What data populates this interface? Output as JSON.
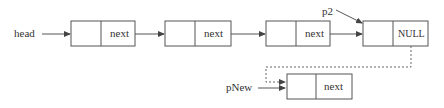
{
  "diagram": {
    "title": "",
    "labels": {
      "head": "head",
      "p2": "p2",
      "pNew": "pNew"
    },
    "nodes": [
      {
        "id": "node1",
        "data": "",
        "pointer": "next"
      },
      {
        "id": "node2",
        "data": "",
        "pointer": "next"
      },
      {
        "id": "node3",
        "data": "",
        "pointer": "next"
      },
      {
        "id": "node4",
        "data": "",
        "pointer": "NULL"
      },
      {
        "id": "new_node",
        "data": "",
        "pointer": "next"
      }
    ],
    "edges": [
      {
        "from": "head",
        "to": "node1",
        "style": "solid"
      },
      {
        "from": "node1",
        "to": "node2",
        "style": "solid"
      },
      {
        "from": "node2",
        "to": "node3",
        "style": "solid"
      },
      {
        "from": "node3",
        "to": "node4",
        "style": "solid"
      },
      {
        "from": "p2",
        "to": "node4",
        "style": "solid"
      },
      {
        "from": "node4",
        "to": "new_node",
        "style": "dashed"
      },
      {
        "from": "pNew",
        "to": "new_node",
        "style": "solid"
      }
    ],
    "colors": {
      "stroke": "#555555",
      "text": "#333333",
      "background": "#ffffff"
    }
  }
}
